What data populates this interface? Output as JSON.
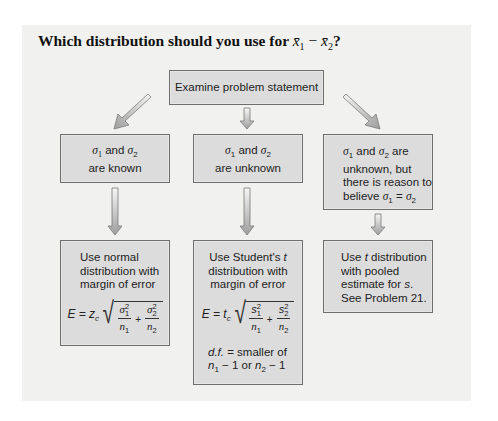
{
  "title": {
    "prefix": "Which distribution should you use for ",
    "var1": "x̄",
    "sub1": "1",
    "minus": " − ",
    "var2": "x̄",
    "sub2": "2",
    "suffix": "?"
  },
  "colors": {
    "panel_bg": "#f1f1ef",
    "box_fill": "#dcdcdc",
    "box_border": "#6e6e6e",
    "arrow_fill_light": "#f4f4f4",
    "arrow_fill_dark": "#a8a8a8",
    "arrow_stroke": "#7a7a7a"
  },
  "diagram": {
    "root": {
      "label": "Examine problem statement"
    },
    "conditions": [
      {
        "id": "known",
        "sigma1": "σ",
        "s1": "1",
        "and": " and ",
        "sigma2": "σ",
        "s2": "2",
        "line2": "are known"
      },
      {
        "id": "unknown",
        "sigma1": "σ",
        "s1": "1",
        "and": " and ",
        "sigma2": "σ",
        "s2": "2",
        "line2": "are unknown"
      },
      {
        "id": "unknown-equal",
        "sigma1": "σ",
        "s1": "1",
        "and": " and ",
        "sigma2": "σ",
        "s2": "2",
        "are": " are",
        "line2": "unknown, but",
        "line3": "there is reason to",
        "line4_prefix": "believe ",
        "eq_lhs": "σ",
        "eq_lhs_sub": "1",
        "eq_op": " = ",
        "eq_rhs": "σ",
        "eq_rhs_sub": "2"
      }
    ],
    "outcomes": [
      {
        "id": "normal",
        "line1": "Use normal",
        "line2": "distribution with",
        "line3": "margin of error",
        "formula": {
          "lhs": "E = z",
          "lhs_sub": "c",
          "num1": "σ",
          "num1_sup": "2",
          "num1_sub": "1",
          "den1": "n",
          "den1_sub": "1",
          "plus": "+",
          "num2": "σ",
          "num2_sup": "2",
          "num2_sub": "2",
          "den2": "n",
          "den2_sub": "2"
        }
      },
      {
        "id": "student-t",
        "line1_prefix": "Use Student's ",
        "line1_var": "t",
        "line2": "distribution with",
        "line3": "margin of error",
        "formula": {
          "lhs": "E = t",
          "lhs_sub": "c",
          "num1": "s",
          "num1_sup": "2",
          "num1_sub": "1",
          "den1": "n",
          "den1_sub": "1",
          "plus": "+",
          "num2": "s",
          "num2_sup": "2",
          "num2_sub": "2",
          "den2": "n",
          "den2_sub": "2"
        },
        "df_label": "d.f.",
        "df_text": " = smaller of",
        "df_n1": "n",
        "df_n1_sub": "1",
        "df_mid": " − 1 or ",
        "df_n2": "n",
        "df_n2_sub": "2",
        "df_end": " − 1"
      },
      {
        "id": "pooled-t",
        "line1_prefix": "Use ",
        "line1_var": "t",
        "line1_suffix": " distribution",
        "line2": "with pooled",
        "line3_prefix": "estimate for ",
        "line3_var": "s",
        "line3_suffix": ".",
        "line4": "See Problem 21."
      }
    ]
  }
}
